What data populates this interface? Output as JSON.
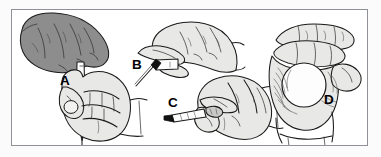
{
  "figure": {
    "background_color": "#ffffff",
    "frame_color": "#8e9296",
    "line_color": "#1a1a1a",
    "shade_dark": "#8d8d8d",
    "shade_light": "#dcdcda",
    "panel_count": 4,
    "caption": ""
  },
  "panels": [
    {
      "id": "A",
      "label": "A",
      "subject": "two hands, upper shaded hand guiding a lower fist gripping a vertical pen",
      "hand_shading": "dark-gray",
      "object": "pen",
      "object_orientation": "vertical, tip pointing down"
    },
    {
      "id": "B",
      "label": "B",
      "subject": "hand pinching an instrument between thumb and index finger",
      "hand_shading": "light",
      "object": "pen",
      "object_orientation": "angled down-left"
    },
    {
      "id": "C",
      "label": "C",
      "subject": "closed fist holding a small instrument pointing left",
      "hand_shading": "light",
      "object": "pen",
      "object_orientation": "horizontal, tip pointing left"
    },
    {
      "id": "D",
      "label": "D",
      "subject": "hand cupping a round ball-shaped object",
      "hand_shading": "light",
      "object": "ball",
      "object_orientation": "held in palm"
    }
  ]
}
